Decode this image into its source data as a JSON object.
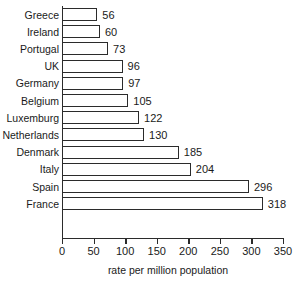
{
  "chart_data": {
    "type": "bar",
    "orientation": "horizontal",
    "title": "",
    "subtitle": "",
    "xlabel": "rate per million population",
    "ylabel": "",
    "xlim": [
      0,
      350
    ],
    "xticks": [
      0,
      50,
      100,
      150,
      200,
      250,
      300,
      350
    ],
    "grid": false,
    "legend": null,
    "bar_fill_color": "#ffffff",
    "bar_edge_color": "#2b2b2b",
    "categories": [
      "Greece",
      "Ireland",
      "Portugal",
      "UK",
      "Germany",
      "Belgium",
      "Luxemburg",
      "Netherlands",
      "Denmark",
      "Italy",
      "Spain",
      "France"
    ],
    "values": [
      56,
      60,
      73,
      96,
      97,
      105,
      122,
      130,
      185,
      204,
      296,
      318
    ],
    "data_labels": [
      "56",
      "60",
      "73",
      "96",
      "97",
      "105",
      "122",
      "130",
      "185",
      "204",
      "296",
      "318"
    ],
    "tick_labels": [
      "0",
      "50",
      "100",
      "150",
      "200",
      "250",
      "300",
      "350"
    ]
  }
}
